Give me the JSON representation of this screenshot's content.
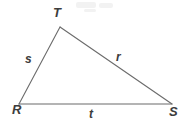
{
  "figure": {
    "name": "triangle-rst",
    "background_color": "#ffffff",
    "stroke_color": "#6b6b6b",
    "text_color": "#3c3c3c"
  },
  "vertices": [
    {
      "id": "T",
      "label": "T",
      "x": 60,
      "y": 27,
      "label_x": 53,
      "label_y": 6
    },
    {
      "id": "R",
      "label": "R",
      "x": 19,
      "y": 104,
      "label_x": 12,
      "label_y": 103
    },
    {
      "id": "S",
      "label": "S",
      "x": 172,
      "y": 104,
      "label_x": 169,
      "label_y": 105
    }
  ],
  "sides": [
    {
      "id": "s",
      "label": "s",
      "from": "R",
      "to": "T",
      "label_x": 25,
      "label_y": 53
    },
    {
      "id": "r",
      "label": "r",
      "from": "T",
      "to": "S",
      "label_x": 116,
      "label_y": 51
    },
    {
      "id": "t",
      "label": "t",
      "from": "R",
      "to": "S",
      "label_x": 89,
      "label_y": 108
    }
  ]
}
